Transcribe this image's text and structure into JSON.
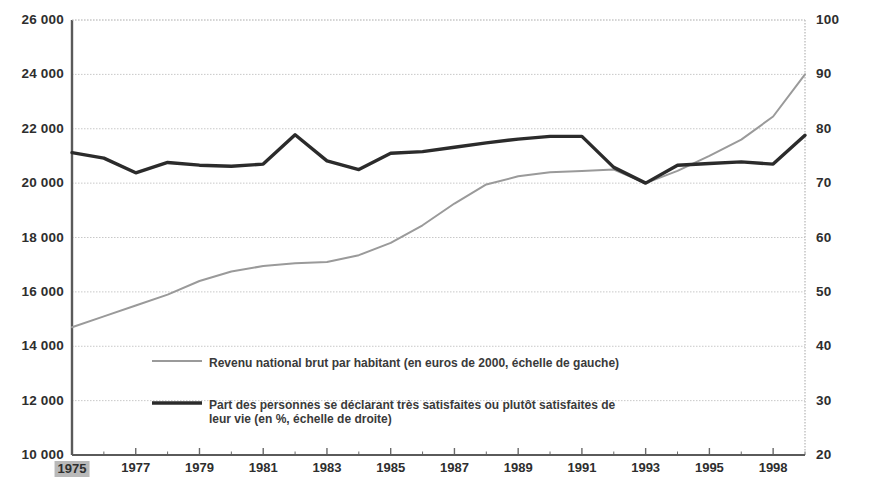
{
  "chart_data": {
    "type": "line",
    "title": "",
    "subtitle": "",
    "xlabel": "",
    "grid": true,
    "legend_position": "inside-bottom-left",
    "x": [
      1975,
      1976,
      1977,
      1978,
      1979,
      1980,
      1981,
      1982,
      1983,
      1984,
      1985,
      1986,
      1987,
      1988,
      1989,
      1990,
      1991,
      1992,
      1993,
      1994,
      1995,
      1996,
      1997,
      1998
    ],
    "xtick_labels": [
      "1975",
      "1977",
      "1979",
      "1981",
      "1983",
      "1985",
      "1987",
      "1989",
      "1991",
      "1993",
      "1995",
      "1998"
    ],
    "xtick_years": [
      1975,
      1977,
      1979,
      1981,
      1983,
      1985,
      1987,
      1989,
      1991,
      1993,
      1995,
      1997
    ],
    "highlighted_xtick": "1975",
    "xlim": [
      1975,
      1998
    ],
    "axes": {
      "left": {
        "label": "",
        "ylim": [
          10000,
          26000
        ],
        "tick_step": 2000,
        "tick_labels": [
          "26 000",
          "24 000",
          "22 000",
          "20 000",
          "18 000",
          "16 000",
          "14 000",
          "12 000",
          "10 000"
        ],
        "tick_values": [
          26000,
          24000,
          22000,
          20000,
          18000,
          16000,
          14000,
          12000,
          10000
        ]
      },
      "right": {
        "label": "",
        "ylim": [
          20,
          100
        ],
        "tick_step": 10,
        "tick_labels": [
          "100",
          "90",
          "80",
          "70",
          "60",
          "50",
          "40",
          "30",
          "20"
        ],
        "tick_values": [
          100,
          90,
          80,
          70,
          60,
          50,
          40,
          30,
          20
        ]
      }
    },
    "series": [
      {
        "name": "Revenu national brut par habitant (en euros de 2000, échelle de gauche)",
        "short_name": "revenu-national-brut",
        "axis": "left",
        "unit": "euros de 2000",
        "color": "#9a9a9a",
        "width": 2,
        "values": [
          14700,
          15100,
          15500,
          15900,
          16400,
          16750,
          16950,
          17050,
          17100,
          17350,
          17800,
          18450,
          19250,
          19950,
          20250,
          20400,
          20450,
          20500,
          20000,
          20450,
          21000,
          21600,
          22450,
          24000
        ]
      },
      {
        "name": "Part des personnes se déclarant très satisfaites ou plutôt satisfaites de leur vie (en %, échelle de droite)",
        "short_name": "part-personnes-satisfaites",
        "axis": "right",
        "unit": "%",
        "color": "#2b2b2b",
        "width": 3.4,
        "values": [
          75.6,
          74.6,
          71.9,
          73.8,
          73.3,
          73.1,
          73.5,
          78.9,
          74.1,
          72.5,
          75.5,
          75.8,
          76.6,
          77.4,
          78.1,
          78.6,
          78.6,
          72.9,
          70.0,
          73.3,
          73.6,
          73.9,
          73.5,
          78.8
        ]
      }
    ],
    "legend": [
      {
        "label": "Revenu national brut par habitant (en euros de 2000, échelle de gauche)",
        "color": "#9a9a9a",
        "width": 2
      },
      {
        "label": "Part des personnes se déclarant très satisfaites ou plutôt satisfaites de leur vie (en %, échelle de droite)",
        "color": "#2b2b2b",
        "width": 3.4
      }
    ]
  }
}
